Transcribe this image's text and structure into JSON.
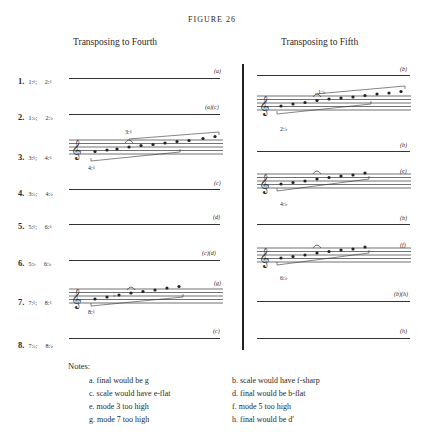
{
  "figure": {
    "title": "FIGURE 26",
    "left_heading": "Transposing to Fourth",
    "right_heading": "Transposing to Fifth"
  },
  "rows": [
    {
      "num": "1.",
      "from": "1:♮;",
      "to": "2:♮",
      "left_note": "(a)",
      "right_note": "(b)"
    },
    {
      "num": "2.",
      "from": "1:♭;",
      "to": "2:♭",
      "left_note": "(a)(c)",
      "right_note": "(b)"
    },
    {
      "num": "3.",
      "from": "3:♮;",
      "to": "4:♮",
      "left_note": "",
      "right_note": "(b)"
    },
    {
      "num": "4.",
      "from": "3:♭;",
      "to": "4:♭",
      "left_note": "(c)",
      "right_note": "(e)"
    },
    {
      "num": "5.",
      "from": "5:♮;",
      "to": "6:♮",
      "left_note": "(d)",
      "right_note": "(b)"
    },
    {
      "num": "6.",
      "from": "5:♭",
      "to": "6:♭",
      "left_note": "(c)(d)",
      "right_note": "(f)"
    },
    {
      "num": "7.",
      "from": "7:♮;",
      "to": "8:♮",
      "left_note": "(g)",
      "right_note": "(b)(h)"
    },
    {
      "num": "8.",
      "from": "7:♭;",
      "to": "8:♭",
      "left_note": "(c)",
      "right_note": "(h)"
    }
  ],
  "staff_labels": {
    "left_row3_upper": "3:♮",
    "left_row3_lower": "4:♮",
    "left_row7_lower": "8:♮",
    "right_a_upper": "1:♭",
    "right_a_lower": "2:♭",
    "right_b_lower": "4:♭",
    "right_c_lower": "6:♭",
    "clef_octave": "8"
  },
  "notes": {
    "heading": "Notes:",
    "items": [
      {
        "key": "a.",
        "text": "final would be g"
      },
      {
        "key": "b.",
        "text": "scale would have f-sharp"
      },
      {
        "key": "c.",
        "text": "scale would have e-flat"
      },
      {
        "key": "d.",
        "text": "final would be b-flat"
      },
      {
        "key": "e.",
        "text": "mode 3 too high"
      },
      {
        "key": "f.",
        "text": "mode 5 too high"
      },
      {
        "key": "g.",
        "text": "mode 7 too high"
      },
      {
        "key": "h.",
        "text": "final would be d′"
      }
    ]
  }
}
